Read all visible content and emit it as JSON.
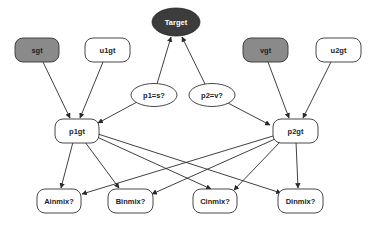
{
  "diagram": {
    "type": "directed-graph",
    "colors": {
      "background": "#ffffff",
      "edge": "#2a2a2a",
      "node_stroke": "#333333",
      "gray_fill": "#8a8a8a",
      "dark_fill": "#3c3c3c",
      "white_fill": "#ffffff",
      "dark_text": "#222222",
      "light_text": "#ffffff"
    },
    "nodes": {
      "target": {
        "label": "Target",
        "shape": "ellipse",
        "fill": "dark"
      },
      "sgt": {
        "label": "sgt",
        "shape": "rounded-rect",
        "fill": "gray"
      },
      "u1gt": {
        "label": "u1gt",
        "shape": "rounded-rect",
        "fill": "white"
      },
      "vgt": {
        "label": "vgt",
        "shape": "rounded-rect",
        "fill": "gray"
      },
      "u2gt": {
        "label": "u2gt",
        "shape": "rounded-rect",
        "fill": "white"
      },
      "p1_eq_s": {
        "label": "p1=s?",
        "shape": "ellipse",
        "fill": "white"
      },
      "p2_eq_v": {
        "label": "p2=v?",
        "shape": "ellipse",
        "fill": "white"
      },
      "p1gt": {
        "label": "p1gt",
        "shape": "rounded-rect",
        "fill": "white"
      },
      "p2gt": {
        "label": "p2gt",
        "shape": "rounded-rect",
        "fill": "white"
      },
      "ainmix": {
        "label": "Ainmix?",
        "shape": "rounded-rect",
        "fill": "white"
      },
      "binmix": {
        "label": "Binmix?",
        "shape": "rounded-rect",
        "fill": "white"
      },
      "cinmix": {
        "label": "Cinmix?",
        "shape": "rounded-rect",
        "fill": "white"
      },
      "dinmix": {
        "label": "Dinmix?",
        "shape": "rounded-rect",
        "fill": "white"
      }
    },
    "edges": [
      {
        "from": "sgt",
        "to": "p1gt"
      },
      {
        "from": "u1gt",
        "to": "p1gt"
      },
      {
        "from": "p1_eq_s",
        "to": "p1gt"
      },
      {
        "from": "p1_eq_s",
        "to": "target"
      },
      {
        "from": "vgt",
        "to": "p2gt"
      },
      {
        "from": "u2gt",
        "to": "p2gt"
      },
      {
        "from": "p2_eq_v",
        "to": "p2gt"
      },
      {
        "from": "p2_eq_v",
        "to": "target"
      },
      {
        "from": "p1gt",
        "to": "ainmix"
      },
      {
        "from": "p1gt",
        "to": "binmix"
      },
      {
        "from": "p1gt",
        "to": "cinmix"
      },
      {
        "from": "p1gt",
        "to": "dinmix"
      },
      {
        "from": "p2gt",
        "to": "ainmix"
      },
      {
        "from": "p2gt",
        "to": "binmix"
      },
      {
        "from": "p2gt",
        "to": "cinmix"
      },
      {
        "from": "p2gt",
        "to": "dinmix"
      }
    ]
  }
}
